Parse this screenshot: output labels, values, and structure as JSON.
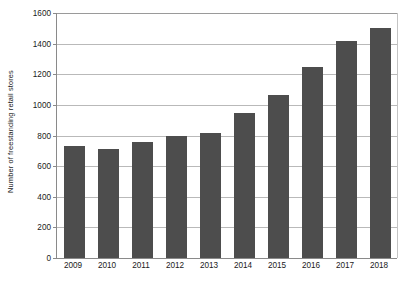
{
  "chart_data": {
    "type": "bar",
    "title": "",
    "xlabel": "",
    "ylabel": "Number of freestanding retail stores",
    "categories": [
      "2009",
      "2010",
      "2011",
      "2012",
      "2013",
      "2014",
      "2015",
      "2016",
      "2017",
      "2018"
    ],
    "values": [
      730,
      715,
      755,
      795,
      815,
      945,
      1065,
      1250,
      1420,
      1500
    ],
    "ylim": [
      0,
      1600
    ],
    "ytick_labels": [
      "0",
      "200",
      "400",
      "600",
      "800",
      "1000",
      "1200",
      "1400",
      "1600"
    ],
    "ytick_values": [
      0,
      200,
      400,
      600,
      800,
      1000,
      1200,
      1400,
      1600
    ],
    "grid": true,
    "legend": false,
    "series": [
      {
        "name": "Number of freestanding retail stores",
        "values": [
          730,
          715,
          755,
          795,
          815,
          945,
          1065,
          1250,
          1420,
          1500
        ]
      }
    ],
    "colors": {
      "bar": "#4d4d4d",
      "gridline": "#b9b9b9",
      "axis": "#8a8a8a",
      "text": "#1a1a1a",
      "background": "#ffffff"
    }
  }
}
